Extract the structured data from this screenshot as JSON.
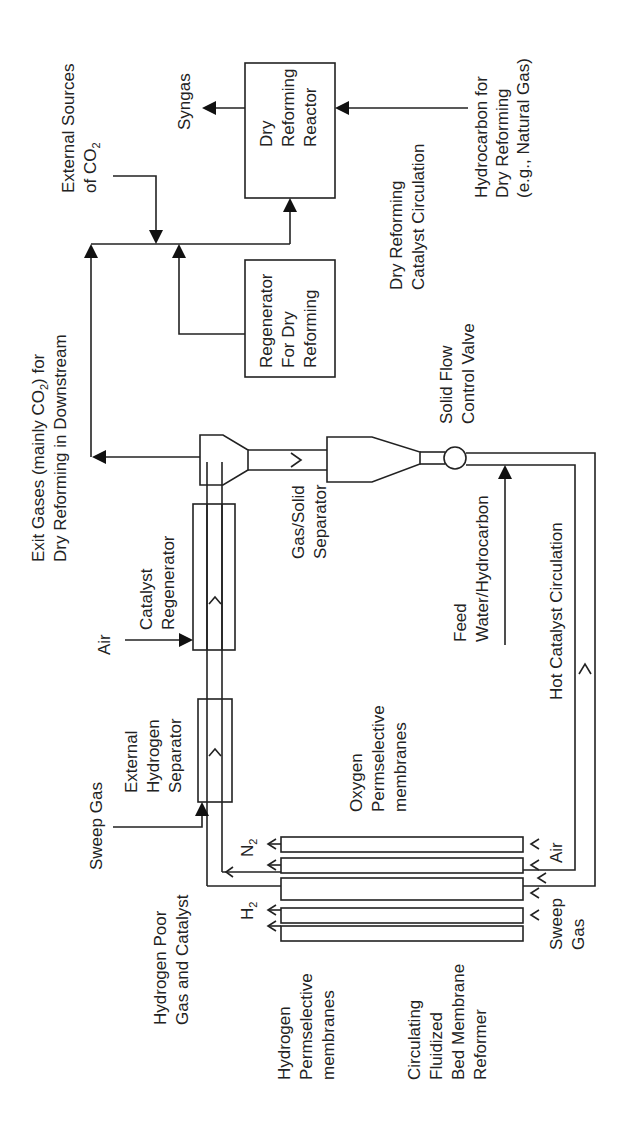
{
  "diagram": {
    "orientation": "rotated 90 degrees counter-clockwise (text reads bottom-to-top)",
    "colors": {
      "line": "#222222",
      "background": "#ffffff"
    },
    "components": {
      "dry_reforming_reactor": [
        "Dry",
        "Reforming",
        "Reactor"
      ],
      "regenerator_dry_reforming": [
        "Regenerator",
        "For Dry",
        "Reforming"
      ],
      "catalyst_regenerator": [
        "Catalyst",
        "Regenerator"
      ],
      "external_hydrogen_separator": [
        "External",
        "Hydrogen",
        "Separator"
      ],
      "gas_solid_separator": [
        "Gas/Solid",
        "Separator"
      ],
      "solid_flow_control_valve": [
        "Solid Flow",
        "Control Valve"
      ],
      "cfbmr": [
        "Circulating",
        "Fluidized",
        "Bed Membrane",
        "Reformer"
      ]
    },
    "labels": {
      "syngas": "Syngas",
      "external_co2": {
        "line1": "External Sources",
        "line2_prefix": "of CO",
        "line2_sub": "2"
      },
      "hydrocarbon_dry": [
        "Hydrocarbon for",
        "Dry Reforming",
        "(e.g., Natural Gas)"
      ],
      "dry_catalyst_circulation": [
        "Dry Reforming",
        "Catalyst Circulation"
      ],
      "exit_gases": {
        "line1_prefix": "Exit Gases (mainly CO",
        "line1_sub": "2",
        "line1_suffix": ") for",
        "line2": "Dry Reforming in Downstream"
      },
      "air_regen": "Air",
      "feed": [
        "Feed",
        "Water/Hydrocarbon"
      ],
      "hot_catalyst_circulation": "Hot Catalyst Circulation",
      "sweep_gas_top": "Sweep Gas",
      "oxygen_membranes": [
        "Oxygen",
        "Permselective",
        "membranes"
      ],
      "n2": {
        "base": "N",
        "sub": "2"
      },
      "h2": {
        "base": "H",
        "sub": "2"
      },
      "hydrogen_poor": [
        "Hydrogen Poor",
        "Gas and Catalyst"
      ],
      "hydrogen_membranes": [
        "Hydrogen",
        "Permselective",
        "membranes"
      ],
      "air_bottom": "Air",
      "sweep_gas_bottom": [
        "Sweep",
        "Gas"
      ]
    }
  }
}
